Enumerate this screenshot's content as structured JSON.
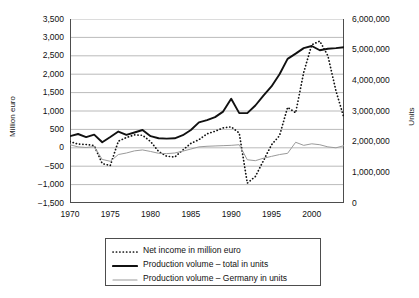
{
  "chart_data": {
    "type": "line",
    "title": "",
    "xlabel": "",
    "ylabel": "Million euro",
    "y2label": "Units",
    "xlim": [
      1970,
      2004
    ],
    "ylim": [
      -1500,
      3500
    ],
    "y2lim": [
      0,
      6000000
    ],
    "grid": true,
    "legend_position": "bottom",
    "x_tick_labels": [
      "1970",
      "1975",
      "1980",
      "1985",
      "1990",
      "1995",
      "2000"
    ],
    "x_tick_values": [
      1970,
      1975,
      1980,
      1985,
      1990,
      1995,
      2000
    ],
    "y_tick_labels": [
      "3,500",
      "3,000",
      "2,500",
      "2,000",
      "1,500",
      "1,000",
      "500",
      "0",
      "−500",
      "−1,000",
      "−1,500"
    ],
    "y_tick_values": [
      3500,
      3000,
      2500,
      2000,
      1500,
      1000,
      500,
      0,
      -500,
      -1000,
      -1500
    ],
    "y2_tick_labels": [
      "6,000,000",
      "5,000,000",
      "4,000,000",
      "3,000,000",
      "2,000,000",
      "1,000,000",
      "0"
    ],
    "y2_tick_values": [
      6000000,
      5000000,
      4000000,
      3000000,
      2000000,
      1000000,
      0
    ],
    "x": [
      1970,
      1971,
      1972,
      1973,
      1974,
      1975,
      1976,
      1977,
      1978,
      1979,
      1980,
      1981,
      1982,
      1983,
      1984,
      1985,
      1986,
      1987,
      1988,
      1989,
      1990,
      1991,
      1992,
      1993,
      1994,
      1995,
      1996,
      1997,
      1998,
      1999,
      2000,
      2001,
      2002,
      2003,
      2004
    ],
    "series": [
      {
        "name": "Net income in million euro",
        "axis": "left",
        "style": "dotted",
        "color": "#111111",
        "units": "million euro",
        "values": [
          170,
          100,
          90,
          60,
          -430,
          -480,
          180,
          280,
          350,
          340,
          170,
          -100,
          -230,
          -250,
          -60,
          120,
          220,
          380,
          450,
          540,
          570,
          400,
          -960,
          -780,
          -350,
          80,
          330,
          1100,
          950,
          2050,
          2800,
          2900,
          2500,
          1550,
          810
        ]
      },
      {
        "name": "Production volume – total in units",
        "axis": "right",
        "style": "solid-thick",
        "color": "#111111",
        "units": "units",
        "values": [
          2180000,
          2250000,
          2150000,
          2230000,
          1980000,
          2150000,
          2330000,
          2220000,
          2300000,
          2380000,
          2180000,
          2110000,
          2100000,
          2110000,
          2210000,
          2380000,
          2630000,
          2700000,
          2800000,
          2980000,
          3400000,
          2930000,
          2930000,
          3180000,
          3500000,
          3800000,
          4200000,
          4700000,
          4870000,
          5050000,
          5120000,
          4980000,
          5030000,
          5050000,
          5080000
        ]
      },
      {
        "name": "Production volume – Germany in units",
        "axis": "right",
        "style": "solid-thin",
        "color": "#9a9a9a",
        "units": "units",
        "values": [
          1900000,
          1830000,
          1810000,
          1840000,
          1420000,
          1360000,
          1580000,
          1630000,
          1700000,
          1730000,
          1680000,
          1620000,
          1610000,
          1630000,
          1690000,
          1760000,
          1830000,
          1850000,
          1860000,
          1870000,
          1880000,
          1900000,
          1410000,
          1380000,
          1460000,
          1520000,
          1580000,
          1620000,
          1980000,
          1880000,
          1930000,
          1900000,
          1830000,
          1800000,
          1870000
        ]
      }
    ],
    "legend": [
      {
        "label": "Net income in million euro",
        "style": "dotted",
        "color": "#111111"
      },
      {
        "label": "Production volume – total in units",
        "style": "solid-thick",
        "color": "#111111"
      },
      {
        "label": "Production volume – Germany in units",
        "style": "solid-thin",
        "color": "#9a9a9a"
      }
    ]
  }
}
